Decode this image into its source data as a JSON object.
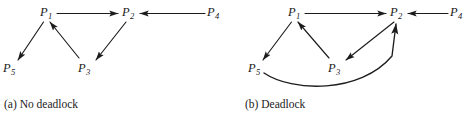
{
  "figure": {
    "background_color": "#ffffff",
    "line_color": "#1c1c1c",
    "text_color": "#1a1a1a",
    "width": 465,
    "height": 124
  },
  "panels": [
    {
      "id": "a",
      "caption": "(a) No deadlock",
      "nodes": [
        {
          "id": "P1",
          "base": "P",
          "sub": "1",
          "x": 40,
          "y": 6
        },
        {
          "id": "P2",
          "base": "P",
          "sub": "2",
          "x": 122,
          "y": 6
        },
        {
          "id": "P3",
          "base": "P",
          "sub": "3",
          "x": 78,
          "y": 62
        },
        {
          "id": "P4",
          "base": "P",
          "sub": "4",
          "x": 207,
          "y": 6
        },
        {
          "id": "P5",
          "base": "P",
          "sub": "5",
          "x": 3,
          "y": 62
        }
      ],
      "edges": [
        {
          "from": "P1",
          "to": "P2",
          "shape": "straight"
        },
        {
          "from": "P4",
          "to": "P2",
          "shape": "straight"
        },
        {
          "from": "P1",
          "to": "P5",
          "shape": "straight"
        },
        {
          "from": "P3",
          "to": "P1",
          "shape": "straight"
        },
        {
          "from": "P2",
          "to": "P3",
          "shape": "straight"
        }
      ]
    },
    {
      "id": "b",
      "caption": "(b) Deadlock",
      "nodes": [
        {
          "id": "P1",
          "base": "P",
          "sub": "1",
          "x": 56,
          "y": 6
        },
        {
          "id": "P2",
          "base": "P",
          "sub": "2",
          "x": 158,
          "y": 6
        },
        {
          "id": "P3",
          "base": "P",
          "sub": "3",
          "x": 96,
          "y": 62
        },
        {
          "id": "P4",
          "base": "P",
          "sub": "4",
          "x": 218,
          "y": 6
        },
        {
          "id": "P5",
          "base": "P",
          "sub": "5",
          "x": 16,
          "y": 62
        }
      ],
      "edges": [
        {
          "from": "P1",
          "to": "P2",
          "shape": "straight"
        },
        {
          "from": "P4",
          "to": "P2",
          "shape": "straight"
        },
        {
          "from": "P1",
          "to": "P5",
          "shape": "straight"
        },
        {
          "from": "P3",
          "to": "P1",
          "shape": "straight"
        },
        {
          "from": "P2",
          "to": "P3",
          "shape": "straight"
        },
        {
          "from": "P5",
          "to": "P2",
          "shape": "curved"
        }
      ]
    }
  ]
}
